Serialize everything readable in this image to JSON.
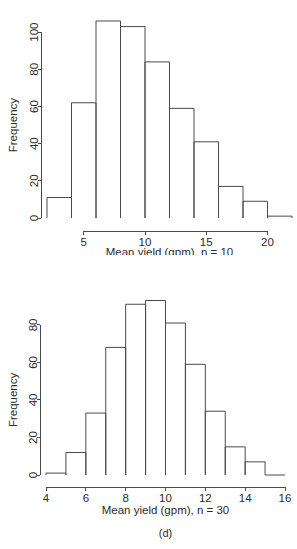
{
  "figure": {
    "panels": [
      {
        "id": "c",
        "caption": "(c)",
        "xlabel": "Mean yield (gpm), n = 10",
        "ylabel": "Frequency"
      },
      {
        "id": "d",
        "caption": "(d)",
        "xlabel": "Mean yield (gpm), n = 30",
        "ylabel": "Frequency"
      }
    ]
  },
  "chart_data": [
    {
      "type": "bar",
      "id": "panel-c",
      "title": "",
      "subtitle": "(c)",
      "xlabel": "Mean yield (gpm), n = 10",
      "ylabel": "Frequency",
      "grid": false,
      "legend": false,
      "histogram": true,
      "bin_width": 2,
      "bin_edges": [
        2,
        4,
        6,
        8,
        10,
        12,
        14,
        16,
        18,
        20,
        22
      ],
      "categories": [
        "2-4",
        "4-6",
        "6-8",
        "8-10",
        "10-12",
        "12-14",
        "14-16",
        "16-18",
        "18-20",
        "20-22"
      ],
      "values": [
        11,
        62,
        106,
        103,
        84,
        59,
        41,
        17,
        9,
        1
      ],
      "xlim": [
        2,
        22
      ],
      "ylim": [
        0,
        106
      ],
      "xticks": [
        5,
        10,
        15,
        20
      ],
      "xticklabels": [
        "5",
        "10",
        "15",
        "20"
      ],
      "yticks": [
        0,
        20,
        40,
        60,
        80,
        100
      ],
      "yticklabels": [
        "0",
        "20",
        "40",
        "60",
        "80",
        "100"
      ]
    },
    {
      "type": "bar",
      "id": "panel-d",
      "title": "",
      "subtitle": "(d)",
      "xlabel": "Mean yield (gpm), n = 30",
      "ylabel": "Frequency",
      "grid": false,
      "legend": false,
      "histogram": true,
      "bin_width": 1,
      "bin_edges": [
        4,
        5,
        6,
        7,
        8,
        9,
        10,
        11,
        12,
        13,
        14,
        15,
        16
      ],
      "categories": [
        "4-5",
        "5-6",
        "6-7",
        "7-8",
        "8-9",
        "9-10",
        "10-11",
        "11-12",
        "12-13",
        "13-14",
        "14-15",
        "15-16"
      ],
      "values": [
        1,
        12,
        33,
        68,
        91,
        93,
        81,
        59,
        34,
        15,
        7,
        0
      ],
      "xlim": [
        4,
        16
      ],
      "ylim": [
        0,
        93
      ],
      "xticks": [
        4,
        6,
        8,
        10,
        12,
        14,
        16
      ],
      "xticklabels": [
        "4",
        "6",
        "8",
        "10",
        "12",
        "14",
        "16"
      ],
      "yticks": [
        0,
        20,
        40,
        60,
        80
      ],
      "yticklabels": [
        "0",
        "20",
        "40",
        "60",
        "80"
      ]
    }
  ]
}
